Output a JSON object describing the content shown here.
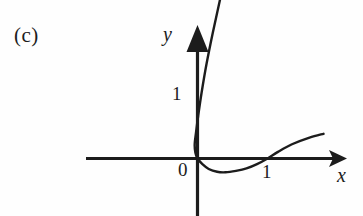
{
  "figure": {
    "panel_label": "(c)",
    "background_color": "#fefefe",
    "ink_color": "#1c1c1c"
  },
  "axes": {
    "x_axis_label": "x",
    "y_axis_label": "y",
    "origin_label": "0",
    "x_tick_label": "1",
    "y_tick_label": "1",
    "x_axis_icon": "arrow-right-icon",
    "y_axis_icon": "arrow-up-icon"
  },
  "chart_data": {
    "type": "line",
    "title": "(c)",
    "xlabel": "x",
    "ylabel": "y",
    "grid": false,
    "legend": null,
    "xlim": [
      -1.6,
      2.2
    ],
    "ylim": [
      -0.45,
      2.1
    ],
    "xticks": [
      0,
      1
    ],
    "xtick_labels": [
      "0",
      "1"
    ],
    "yticks": [
      0,
      1
    ],
    "ytick_labels": [
      "0",
      "1"
    ],
    "annotations": [
      "curve passes through the origin",
      "curve dips below the x-axis between x=0 and x=1",
      "curve crosses the x-axis again at x=1",
      "a steep branch rises from the origin through y=1 and beyond"
    ],
    "series": [
      {
        "name": "curve",
        "comment": "single continuous hand-drawn curve, given as ordered (x, y) points in data coordinates",
        "points": [
          [
            0.43,
            2.05
          ],
          [
            0.33,
            1.7
          ],
          [
            0.22,
            1.33
          ],
          [
            0.13,
            1.0
          ],
          [
            0.06,
            0.7
          ],
          [
            0.01,
            0.45
          ],
          [
            -0.02,
            0.28
          ],
          [
            -0.04,
            0.15
          ],
          [
            -0.03,
            0.06
          ],
          [
            0.0,
            0.0
          ],
          [
            0.07,
            -0.06
          ],
          [
            0.16,
            -0.11
          ],
          [
            0.28,
            -0.14
          ],
          [
            0.4,
            -0.145
          ],
          [
            0.55,
            -0.13
          ],
          [
            0.7,
            -0.105
          ],
          [
            0.85,
            -0.06
          ],
          [
            1.0,
            0.0
          ],
          [
            1.15,
            0.07
          ],
          [
            1.35,
            0.15
          ],
          [
            1.6,
            0.22
          ],
          [
            1.8,
            0.26
          ]
        ]
      }
    ]
  }
}
